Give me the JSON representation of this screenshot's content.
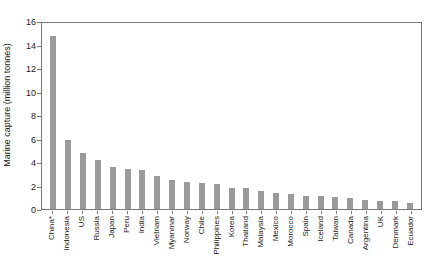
{
  "chart_data": {
    "type": "bar",
    "title": "",
    "xlabel": "",
    "ylabel": "Marine capture (million tonnes)",
    "ylim": [
      0,
      16
    ],
    "yticks": [
      0,
      2,
      4,
      6,
      8,
      10,
      12,
      14,
      16
    ],
    "grid": false,
    "legend": "none",
    "bar_color": "#9b9b9b",
    "axis_color": "#7a7a7a",
    "categories": [
      "China*",
      "Indonesia",
      "US",
      "Russia",
      "Japan",
      "Peru",
      "India",
      "Vietnam",
      "Myanmar",
      "Norway",
      "Chile",
      "Philippines",
      "Korea",
      "Thailand",
      "Malaysia",
      "Mexico",
      "Morocco",
      "Spain",
      "Iceland",
      "Taiwan",
      "Canada",
      "Argentina",
      "UK",
      "Denmark",
      "Ecuador"
    ],
    "values": [
      14.7,
      5.9,
      4.8,
      4.2,
      3.6,
      3.4,
      3.3,
      2.8,
      2.5,
      2.3,
      2.2,
      2.1,
      1.8,
      1.8,
      1.5,
      1.4,
      1.3,
      1.1,
      1.1,
      1.0,
      0.9,
      0.8,
      0.7,
      0.7,
      0.5
    ]
  }
}
